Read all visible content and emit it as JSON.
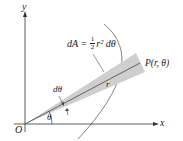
{
  "diagram": {
    "axis_labels": {
      "x": "x",
      "y": "y",
      "origin": "O"
    },
    "formula": {
      "lhs": "dA",
      "eq": "=",
      "num": "1",
      "den": "2",
      "rhs": "r² dθ"
    },
    "point_label": "P(r, θ)",
    "radius_label": "r",
    "dtheta_label": "dθ",
    "theta_label": "θ",
    "colors": {
      "sector": "#cfcfcf",
      "line": "#555555",
      "axis": "#333333"
    }
  }
}
